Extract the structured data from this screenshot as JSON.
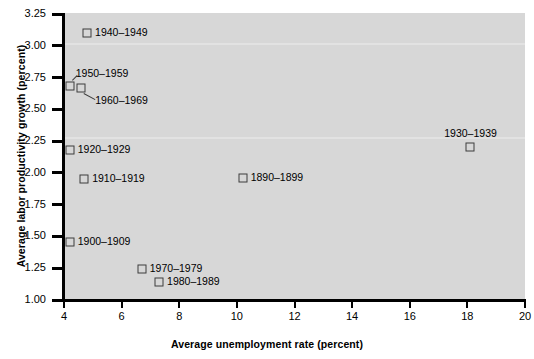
{
  "chart_data": {
    "type": "scatter",
    "title": "",
    "xlabel": "Average unemployment rate (percent)",
    "ylabel": "Average labor productivity growth (percent)",
    "xlim": [
      4,
      20
    ],
    "ylim": [
      1.0,
      3.25
    ],
    "xticks": [
      "4",
      "6",
      "8",
      "10",
      "12",
      "14",
      "16",
      "18",
      "20"
    ],
    "xtick_values": [
      4,
      6,
      8,
      10,
      12,
      14,
      16,
      18,
      20
    ],
    "yticks": [
      "1.00",
      "1.25",
      "1.50",
      "1.75",
      "2.00",
      "2.25",
      "2.50",
      "2.75",
      "3.00",
      "3.25"
    ],
    "ytick_values": [
      1.0,
      1.25,
      1.5,
      1.75,
      2.0,
      2.25,
      2.5,
      2.75,
      3.0,
      3.25
    ],
    "grid": false,
    "legend": "none",
    "marker": "open-square",
    "points": [
      {
        "label": "1940–1949",
        "x": 4.8,
        "y": 3.1,
        "label_pos": "right"
      },
      {
        "label": "1950–1959",
        "x": 4.2,
        "y": 2.68,
        "label_pos": "above-leader"
      },
      {
        "label": "1960–1969",
        "x": 4.6,
        "y": 2.67,
        "label_pos": "below-leader"
      },
      {
        "label": "1920–1929",
        "x": 4.2,
        "y": 2.18,
        "label_pos": "right"
      },
      {
        "label": "1930–1939",
        "x": 18.1,
        "y": 2.2,
        "label_pos": "above"
      },
      {
        "label": "1910–1919",
        "x": 4.7,
        "y": 1.95,
        "label_pos": "right"
      },
      {
        "label": "1890–1899",
        "x": 10.2,
        "y": 1.96,
        "label_pos": "right"
      },
      {
        "label": "1900–1909",
        "x": 4.2,
        "y": 1.46,
        "label_pos": "right"
      },
      {
        "label": "1970–1979",
        "x": 6.7,
        "y": 1.24,
        "label_pos": "right"
      },
      {
        "label": "1980–1989",
        "x": 7.3,
        "y": 1.14,
        "label_pos": "right"
      }
    ]
  },
  "colors": {
    "page_background": "#ffffff",
    "plot_background": "#d7d7d7",
    "axis": "#000000",
    "marker_stroke": "#3c3c3c",
    "text": "#000000"
  }
}
